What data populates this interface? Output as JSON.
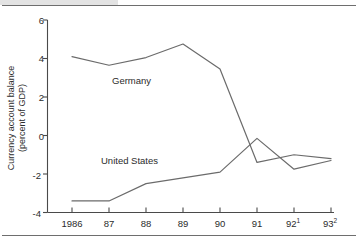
{
  "figure": {
    "ylabel_line1": "Currency account balance",
    "ylabel_line2": "(percent of GDP)"
  },
  "axes": {
    "y_ticks": [
      "6",
      "4",
      "2",
      "0",
      "-2",
      "-4"
    ],
    "x_ticks": [
      {
        "label": "1986",
        "sup": ""
      },
      {
        "label": "87",
        "sup": ""
      },
      {
        "label": "88",
        "sup": ""
      },
      {
        "label": "89",
        "sup": ""
      },
      {
        "label": "90",
        "sup": ""
      },
      {
        "label": "91",
        "sup": ""
      },
      {
        "label": "92",
        "sup": "1"
      },
      {
        "label": "93",
        "sup": "2"
      }
    ]
  },
  "series_labels": {
    "germany": "Germany",
    "united_states": "United States"
  },
  "colors": {
    "line": "#6b6b6b",
    "axis": "#4a4a4a",
    "rule": "#6e6e6e",
    "band": "#e3e3e3",
    "text": "#2b2b2b"
  },
  "chart_data": {
    "type": "line",
    "title": "",
    "xlabel": "",
    "ylabel": "Currency account balance (percent of GDP)",
    "categories": [
      "1986",
      "87",
      "88",
      "89",
      "90",
      "91",
      "92¹",
      "93²"
    ],
    "x": [
      1986,
      1987,
      1988,
      1989,
      1990,
      1991,
      1992,
      1993
    ],
    "ylim": [
      -4,
      6
    ],
    "xlim": [
      1986,
      1993
    ],
    "yticks": [
      -4,
      -2,
      0,
      2,
      4,
      6
    ],
    "grid": false,
    "legend": "inline-annotation",
    "series": [
      {
        "name": "Germany",
        "values": [
          4.1,
          3.65,
          4.05,
          4.75,
          3.45,
          -1.4,
          -1.0,
          -1.2
        ],
        "color": "#6b6b6b"
      },
      {
        "name": "United States",
        "values": [
          -3.4,
          -3.4,
          -2.5,
          -2.2,
          -1.9,
          -0.15,
          -1.75,
          -1.3
        ],
        "color": "#6b6b6b"
      }
    ],
    "annotations": [
      {
        "text": "Germany",
        "x": 1988.05,
        "y": 2.85
      },
      {
        "text": "United States",
        "x": 1987.8,
        "y": -1.35
      }
    ]
  }
}
